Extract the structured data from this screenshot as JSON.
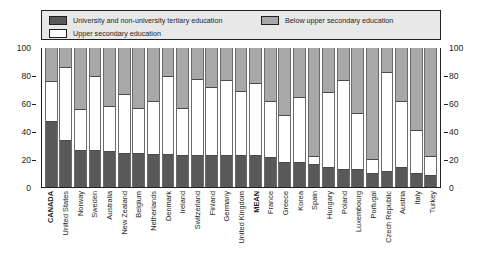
{
  "legend": {
    "items": [
      {
        "key": "tertiary",
        "label": "University and non-university tertiary education",
        "color": "#595959"
      },
      {
        "key": "upper",
        "label": "Upper secondary education",
        "color": "#ffffff"
      },
      {
        "key": "below",
        "label": "Below upper secondary education",
        "color": "#a8a8a8"
      }
    ]
  },
  "axis": {
    "left_ticks": [
      "100",
      "80",
      "60",
      "40",
      "20",
      "0"
    ],
    "right_ticks": [
      "100",
      "80",
      "60",
      "40",
      "20",
      "0"
    ]
  },
  "chart_data": {
    "type": "bar",
    "subtype": "stacked-bar-100-percent",
    "title": "",
    "subtitle": "",
    "xlabel": "",
    "ylabel": "",
    "ylim": [
      0,
      100
    ],
    "yticks": [
      0,
      20,
      40,
      60,
      80,
      100
    ],
    "grid": false,
    "legend_position": "top",
    "categories": [
      "CANADA",
      "United States",
      "Norway",
      "Sweden",
      "Australia",
      "New Zealand",
      "Belgium",
      "Netherlands",
      "Denmark",
      "Ireland",
      "Switzerland",
      "Finland",
      "Germany",
      "United Kingdom",
      "MEAN",
      "France",
      "Greece",
      "Korea",
      "Spain",
      "Hungary",
      "Poland",
      "Luxembourg",
      "Portugal",
      "Czech Republic",
      "Austria",
      "Italy",
      "Turkey"
    ],
    "highlighted_categories": [
      "CANADA",
      "MEAN"
    ],
    "series": [
      {
        "name": "University and non-university tertiary education",
        "color": "#595959",
        "values": [
          47,
          33,
          26,
          26,
          25,
          24,
          24,
          23,
          23,
          22,
          22,
          22,
          22,
          22,
          22,
          21,
          17,
          17,
          16,
          14,
          12,
          12,
          9,
          11,
          14,
          9,
          8
        ]
      },
      {
        "name": "Upper secondary education",
        "color": "#ffffff",
        "values": [
          29,
          53,
          30,
          54,
          33,
          43,
          33,
          39,
          57,
          35,
          56,
          50,
          55,
          47,
          53,
          41,
          35,
          48,
          6,
          54,
          65,
          41,
          11,
          72,
          48,
          32,
          14
        ]
      },
      {
        "name": "Below upper secondary education",
        "color": "#a8a8a8",
        "values": [
          24,
          14,
          44,
          20,
          42,
          33,
          43,
          38,
          20,
          43,
          22,
          28,
          23,
          31,
          25,
          38,
          48,
          35,
          78,
          32,
          23,
          47,
          80,
          17,
          38,
          59,
          78
        ]
      }
    ],
    "stack_tops": {
      "tertiary": [
        47,
        33,
        26,
        26,
        25,
        24,
        24,
        23,
        23,
        22,
        22,
        22,
        22,
        22,
        22,
        21,
        17,
        17,
        16,
        14,
        12,
        12,
        9,
        11,
        14,
        9,
        8
      ],
      "upper": [
        76,
        86,
        56,
        80,
        58,
        67,
        57,
        62,
        80,
        57,
        78,
        72,
        77,
        69,
        75,
        62,
        52,
        65,
        22,
        68,
        77,
        53,
        20,
        83,
        62,
        41,
        22
      ],
      "below": [
        100,
        100,
        100,
        100,
        100,
        100,
        100,
        100,
        100,
        100,
        100,
        100,
        100,
        100,
        100,
        100,
        100,
        100,
        100,
        100,
        100,
        100,
        100,
        100,
        100,
        100,
        100
      ]
    }
  }
}
